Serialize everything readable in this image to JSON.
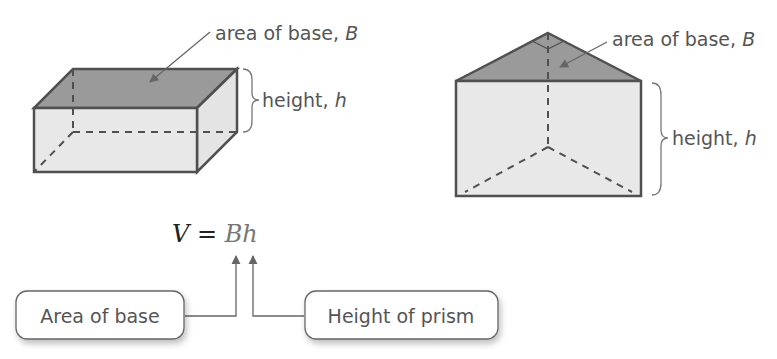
{
  "rect_prism": {
    "base_label": "area of base, ",
    "base_var": "B",
    "height_label": "height, ",
    "height_var": "h"
  },
  "tri_prism": {
    "base_label": "area of base, ",
    "base_var": "B",
    "height_label": "height, ",
    "height_var": "h"
  },
  "formula": {
    "lhs": "V",
    "eq": " = ",
    "rhs": "Bh"
  },
  "callouts": {
    "area_of_base": "Area of base",
    "height_of_prism": "Height of prism"
  },
  "colors": {
    "top_face": "#9a9a9a",
    "side_face": "#e4e4e4",
    "edge": "#505050",
    "label": "#555555"
  }
}
